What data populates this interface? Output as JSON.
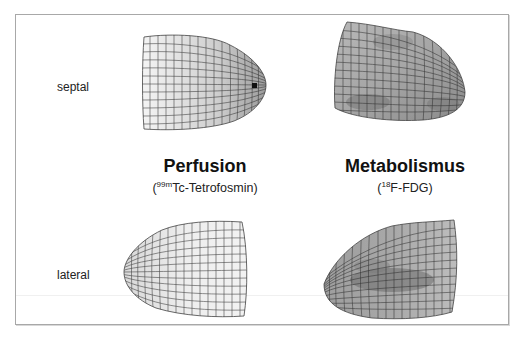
{
  "figure": {
    "row_labels": {
      "top": "septal",
      "bottom": "lateral"
    },
    "columns": [
      {
        "title": "Perfusion",
        "tracer_mass": "99m",
        "tracer_name": "Tc-Tetrofosmin"
      },
      {
        "title": "Metabolismus",
        "tracer_mass": "18",
        "tracer_name": "F-FDG"
      }
    ],
    "panels": [
      {
        "id": "perfusion-septal",
        "column": "Perfusion",
        "view": "septal",
        "shading": "light-gray gradient, dark spot at apex"
      },
      {
        "id": "metabolism-septal",
        "column": "Metabolismus",
        "view": "septal",
        "shading": "mid-gray, patchy darker regions"
      },
      {
        "id": "perfusion-lateral",
        "column": "Perfusion",
        "view": "lateral",
        "shading": "very light gray, homogeneous"
      },
      {
        "id": "metabolism-lateral",
        "column": "Metabolismus",
        "view": "lateral",
        "shading": "mid-gray with darker central band"
      }
    ],
    "colors": {
      "frame": "#a8a8a8",
      "mesh_line": "#2a2a2a",
      "light_fill": "#e6e6e6",
      "mid_fill": "#9a9a9a",
      "dark_fill": "#6e6e6e"
    }
  }
}
